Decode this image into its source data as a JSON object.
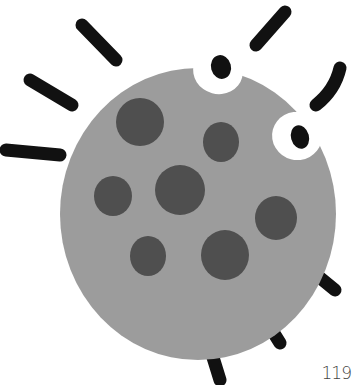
{
  "illustration": {
    "subject": "cartoon germ",
    "colors": {
      "body": "#9c9c9c",
      "spots": "#4f4f4f",
      "legs": "#111111",
      "eye_white": "#ffffff",
      "pupil": "#111111",
      "background": "#ffffff"
    }
  },
  "page": {
    "number": "119"
  }
}
